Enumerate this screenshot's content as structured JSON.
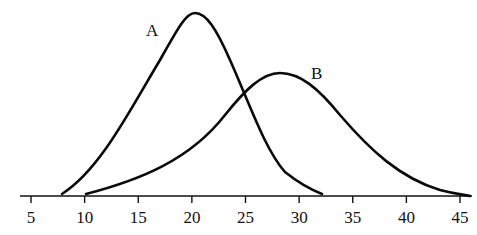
{
  "chart_data": {
    "type": "line",
    "title": "",
    "xlabel": "",
    "ylabel": "",
    "xlim": [
      3,
      46.5
    ],
    "x_ticks": [
      5,
      10,
      15,
      20,
      25,
      30,
      35,
      40,
      45
    ],
    "grid": false,
    "legend": "inline labels",
    "series": [
      {
        "name": "A",
        "label_pos": {
          "x": 150,
          "y": 35
        },
        "peak_x": 20.3,
        "peak_rel_height": 1.0,
        "start_x": 8,
        "end_x": 32,
        "shape": "right-skewed density curve, narrower"
      },
      {
        "name": "B",
        "label_pos": {
          "x": 313,
          "y": 78
        },
        "peak_x": 28.2,
        "peak_rel_height": 0.68,
        "start_x": 10,
        "end_x": 46,
        "shape": "right-skewed density curve, wider and lower"
      }
    ],
    "annotations": [
      "A",
      "B"
    ]
  }
}
